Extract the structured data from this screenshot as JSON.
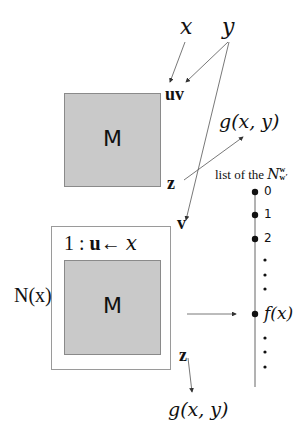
{
  "top": {
    "x_label": "x",
    "y_label": "y",
    "uv_label": "uv",
    "machine_label": "M",
    "z_label": "z",
    "g_label": "g(x, y)",
    "v_label": "v"
  },
  "bottom": {
    "box_title": "1 : u ← x",
    "box_title_num": "1 :",
    "box_title_u": "u",
    "box_title_arrow": "←",
    "box_title_x": "x",
    "outer_label": "N(x)",
    "machine_label": "M",
    "z_label": "z",
    "g_label": "g(x, y)"
  },
  "list": {
    "title": "list of the",
    "title_symbol": "N",
    "title_sup": "w",
    "title_sub": "w′",
    "items": [
      {
        "label": "0",
        "y": 192
      },
      {
        "label": "1",
        "y": 215
      },
      {
        "label": "2",
        "y": 239
      },
      {
        "label": "f(x)",
        "y": 314
      }
    ],
    "ellipsis_dots_upper": [
      260,
      275,
      289
    ],
    "ellipsis_dots_lower": [
      338,
      352,
      367
    ]
  },
  "colors": {
    "machine_fill": "#c9c9c9",
    "line": "#555555",
    "text": "#111111"
  }
}
